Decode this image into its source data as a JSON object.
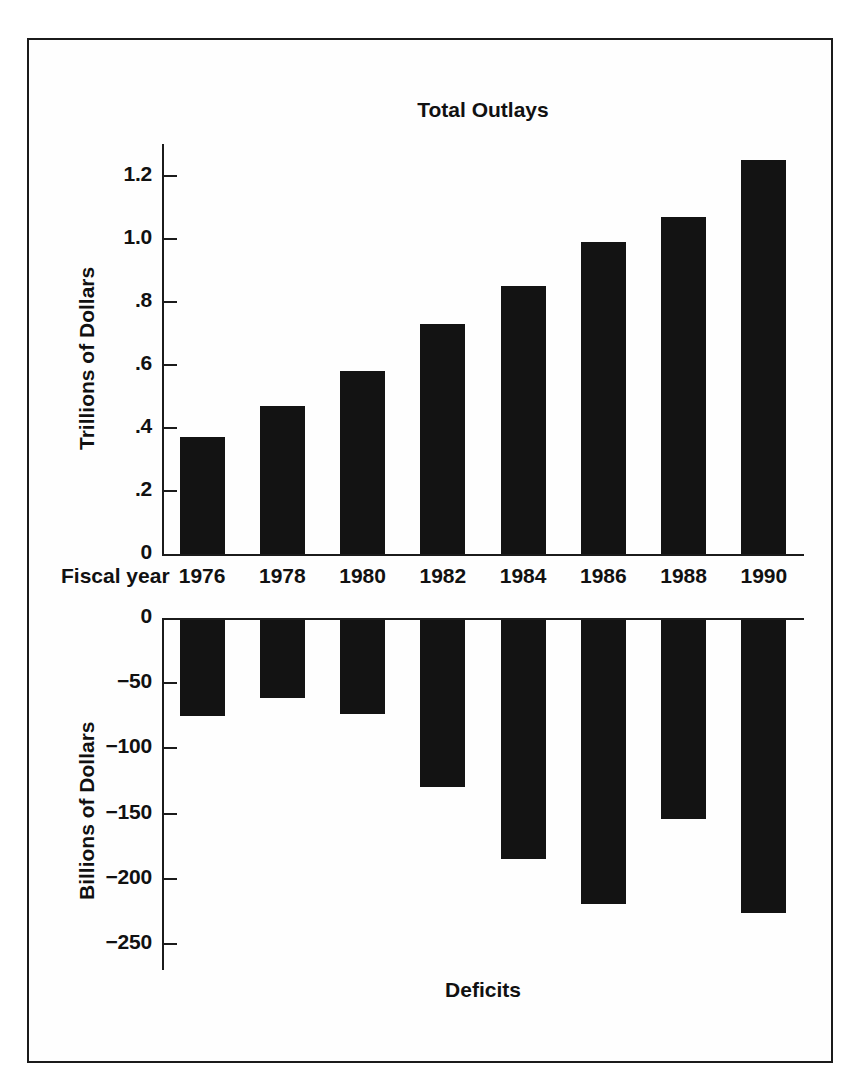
{
  "figure": {
    "background_color": "#ffffff",
    "frame_color": "#1b1b1b",
    "bar_color": "#131313"
  },
  "chart_data": [
    {
      "type": "bar",
      "title": "Total Outlays",
      "xlabel": "Fiscal year",
      "ylabel": "Trillions of Dollars",
      "categories": [
        "1976",
        "1978",
        "1980",
        "1982",
        "1984",
        "1986",
        "1988",
        "1990"
      ],
      "values": [
        0.37,
        0.47,
        0.58,
        0.73,
        0.85,
        0.99,
        1.07,
        1.25
      ],
      "ylim": [
        0,
        1.3
      ],
      "yticks": [
        0,
        0.2,
        0.4,
        0.6,
        0.8,
        1.0,
        1.2
      ],
      "ytick_labels": [
        "0",
        ".2",
        ".4",
        ".6",
        ".8",
        "1.0",
        "1.2"
      ],
      "grid": false,
      "legend": "none"
    },
    {
      "type": "bar",
      "title": "Deficits",
      "xlabel": "",
      "ylabel": "Billions of Dollars",
      "categories": [
        "1976",
        "1978",
        "1980",
        "1982",
        "1984",
        "1986",
        "1988",
        "1990"
      ],
      "values": [
        -74,
        -60,
        -72,
        -128,
        -183,
        -218,
        -153,
        -225
      ],
      "ylim": [
        -270,
        0
      ],
      "yticks": [
        0,
        -50,
        -100,
        -150,
        -200,
        -250
      ],
      "ytick_labels": [
        "0",
        "−50",
        "−100",
        "−150",
        "−200",
        "−250"
      ],
      "grid": false,
      "legend": "none"
    }
  ],
  "top_panel": {
    "title": "Total Outlays",
    "y_axis_title": "Trillions of Dollars",
    "y_tick_labels": [
      "1.2",
      "1.0",
      ".8",
      ".6",
      ".4",
      ".2",
      "0"
    ],
    "x_axis_label": "Fiscal year",
    "x_tick_labels": [
      "1976",
      "1978",
      "1980",
      "1982",
      "1984",
      "1986",
      "1988",
      "1990"
    ],
    "bar_values": [
      0.37,
      0.47,
      0.58,
      0.73,
      0.85,
      0.99,
      1.07,
      1.25
    ]
  },
  "bottom_panel": {
    "title": "Deficits",
    "y_axis_title": "Billions of Dollars",
    "y_tick_labels": [
      "0",
      "−50",
      "−100",
      "−150",
      "−200",
      "−250"
    ],
    "bar_values": [
      -74,
      -60,
      -72,
      -128,
      -183,
      -218,
      -153,
      -225
    ]
  }
}
